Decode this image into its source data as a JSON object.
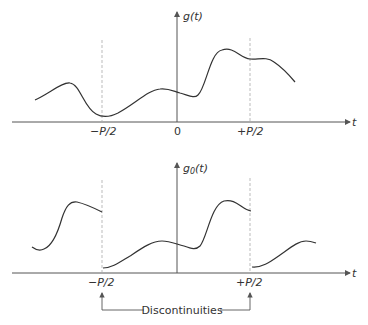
{
  "top_plot": {
    "y_label": "g(t)",
    "x_label": "t",
    "ticks": [
      "−P/2",
      "0",
      "+P/2"
    ]
  },
  "bottom_plot": {
    "y_label_base": "g",
    "y_label_sub": "0",
    "y_label_arg": "(t)",
    "x_label": "t",
    "ticks": [
      "−P/2",
      "+P/2"
    ]
  },
  "annotation": {
    "label": "Discontinuities"
  },
  "colors": {
    "curve": "#333333",
    "axis": "#555555",
    "dashed": "#aaaaaa"
  }
}
